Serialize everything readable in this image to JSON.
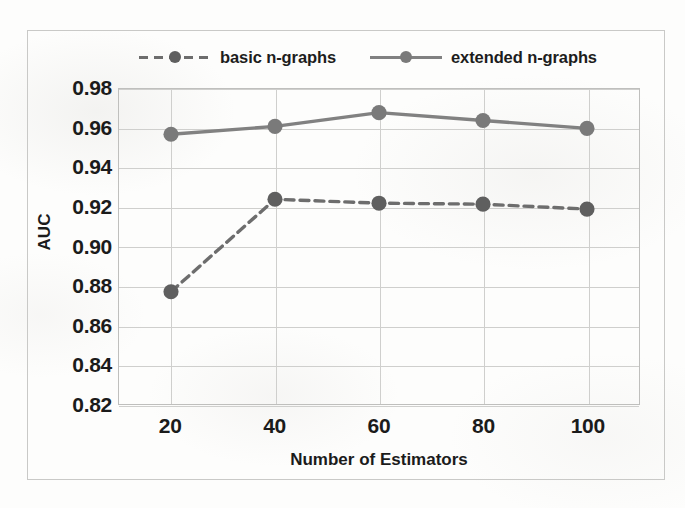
{
  "chart_data": {
    "type": "line",
    "title": "",
    "xlabel": "Number of Estimators",
    "ylabel": "AUC",
    "categories": [
      20,
      40,
      60,
      80,
      100
    ],
    "x": [
      20,
      40,
      60,
      80,
      100
    ],
    "xtick_labels": [
      "20",
      "40",
      "60",
      "80",
      "100"
    ],
    "ytick_labels": [
      "0.98",
      "0.96",
      "0.94",
      "0.92",
      "0.90",
      "0.88",
      "0.86",
      "0.84",
      "0.82"
    ],
    "ytick_values": [
      0.98,
      0.96,
      0.94,
      0.92,
      0.9,
      0.88,
      0.86,
      0.84,
      0.82
    ],
    "ylim": [
      0.82,
      0.98
    ],
    "xlim": [
      10,
      110
    ],
    "grid": true,
    "legend_position": "top",
    "series": [
      {
        "name": "basic n-graphs",
        "style": "dashed",
        "color": "#6d6d6d",
        "marker": "circle",
        "marker_color": "#5f5f5f",
        "values": [
          0.877,
          0.924,
          0.922,
          0.9215,
          0.919
        ]
      },
      {
        "name": "extended n-graphs",
        "style": "solid",
        "color": "#818181",
        "marker": "circle",
        "marker_color": "#7a7a7a",
        "values": [
          0.957,
          0.961,
          0.968,
          0.964,
          0.96
        ]
      }
    ]
  },
  "legend": {
    "entries": [
      {
        "label": "basic n-graphs"
      },
      {
        "label": "extended n-graphs"
      }
    ]
  },
  "axes": {
    "x_title": "Number of Estimators",
    "y_title": "AUC"
  }
}
